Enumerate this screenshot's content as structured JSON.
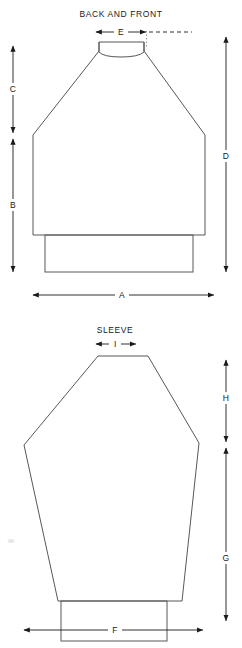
{
  "page": {
    "width": 242,
    "height": 648,
    "background": "#ffffff",
    "line_color": "#58585a",
    "dimension_color": "#1a1a1a"
  },
  "figures": [
    {
      "id": "back-and-front",
      "title": "BACK AND FRONT",
      "dimensions": [
        {
          "key": "A",
          "label": "A",
          "orientation": "horizontal",
          "position": "bottom",
          "describes": "overall body width"
        },
        {
          "key": "B",
          "label": "B",
          "orientation": "vertical",
          "position": "left-lower",
          "describes": "body side length"
        },
        {
          "key": "C",
          "label": "C",
          "orientation": "vertical",
          "position": "left-upper",
          "describes": "shoulder slope height"
        },
        {
          "key": "D",
          "label": "D",
          "orientation": "vertical",
          "position": "right",
          "describes": "total length"
        },
        {
          "key": "E",
          "label": "E",
          "orientation": "horizontal",
          "position": "top",
          "describes": "neck opening width"
        }
      ]
    },
    {
      "id": "sleeve",
      "title": "SLEEVE",
      "dimensions": [
        {
          "key": "F",
          "label": "F",
          "orientation": "horizontal",
          "position": "bottom",
          "describes": "overall sleeve width"
        },
        {
          "key": "G",
          "label": "G",
          "orientation": "vertical",
          "position": "right-lower",
          "describes": "lower sleeve length"
        },
        {
          "key": "H",
          "label": "H",
          "orientation": "vertical",
          "position": "right-upper",
          "describes": "sleeve cap height"
        },
        {
          "key": "I",
          "label": "I",
          "orientation": "horizontal",
          "position": "top",
          "describes": "sleeve cap width"
        }
      ]
    }
  ]
}
